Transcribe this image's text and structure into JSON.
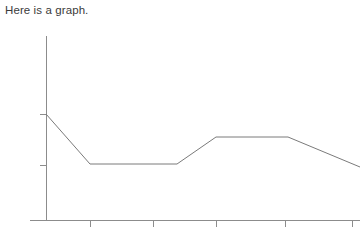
{
  "caption": {
    "text": "Here is a graph."
  },
  "colors": {
    "background": "#ffffff",
    "caption_text": "#3b3b3b",
    "axis": "#8c8c8c",
    "tick": "#8c8c8c",
    "data_line": "#7a7a7a"
  },
  "chart_data": {
    "type": "line",
    "title": "",
    "subtitle": "",
    "xlabel": "",
    "ylabel": "",
    "grid": false,
    "legend": null,
    "legend_position": "none",
    "axis_tick_labels": {
      "x": [
        "",
        "",
        "",
        "",
        ""
      ],
      "y": [
        "",
        ""
      ]
    },
    "x_tick_count": 5,
    "y_tick_count": 2,
    "xlim": [
      0,
      6
    ],
    "ylim": [
      0,
      10
    ],
    "series": [
      {
        "name": "series-1",
        "x": [
          0.0,
          1.4,
          4.2,
          5.5,
          7.8,
          10.1
        ],
        "values": [
          5.75,
          3.05,
          3.05,
          4.5,
          4.5,
          2.9
        ],
        "points_px": [
          [
            46,
            114
          ],
          [
            90,
            164
          ],
          [
            177,
            164
          ],
          [
            216,
            137
          ],
          [
            288,
            137
          ],
          [
            360,
            167
          ]
        ]
      }
    ],
    "annotations": []
  },
  "axes": {
    "y_axis": {
      "x": 46,
      "y_top": 36,
      "y_bottom": 220
    },
    "x_axis": {
      "y": 220,
      "x_left": 30,
      "x_right": 360
    },
    "y_ticks_px": [
      114,
      165
    ],
    "x_ticks_px": [
      90,
      153,
      216,
      285,
      352
    ]
  }
}
